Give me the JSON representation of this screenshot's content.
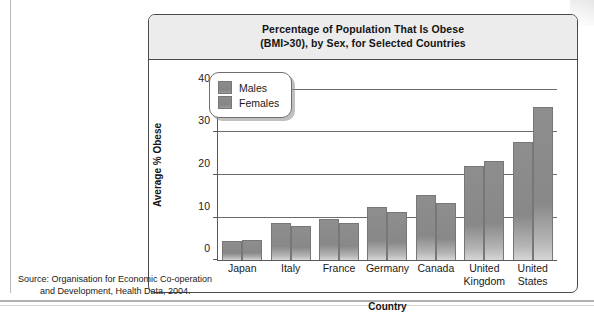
{
  "figure": {
    "title_line1": "Percentage of Population That Is Obese",
    "title_line2": "(BMI>30), by Sex, for Selected Countries"
  },
  "legend": {
    "items": [
      {
        "label": "Males"
      },
      {
        "label": "Females"
      }
    ]
  },
  "source": {
    "line1": "Source: Organisation for Economic Co-operation",
    "line2": "and Development, Health Data, 2004."
  },
  "chart_data": {
    "type": "bar",
    "title": "Percentage of Population That Is Obese (BMI>30), by Sex, for Selected Countries",
    "xlabel": "Country",
    "ylabel": "Average % Obese",
    "ylim": [
      0,
      44
    ],
    "yticks": [
      0,
      10,
      20,
      30,
      40
    ],
    "ytick_labels": [
      "0",
      "10",
      "20",
      "30",
      "40"
    ],
    "grid": true,
    "legend_position": "upper-left-inset",
    "categories": [
      "Japan",
      "Italy",
      "France",
      "Germany",
      "Canada",
      "United Kingdom",
      "United States"
    ],
    "category_label_lines": [
      [
        "Japan"
      ],
      [
        "Italy"
      ],
      [
        "France"
      ],
      [
        "Germany"
      ],
      [
        "Canada"
      ],
      [
        "United",
        "Kingdom"
      ],
      [
        "United",
        "States"
      ]
    ],
    "series": [
      {
        "name": "Males",
        "values": [
          4.5,
          8.8,
          9.6,
          12.4,
          15.2,
          22.1,
          27.7
        ]
      },
      {
        "name": "Females",
        "values": [
          4.8,
          7.9,
          8.8,
          11.3,
          13.4,
          23.2,
          35.9
        ]
      }
    ],
    "bar_color": "#8a8a8a",
    "source_note": "Source: Organisation for Economic Co-operation and Development, Health Data, 2004."
  }
}
